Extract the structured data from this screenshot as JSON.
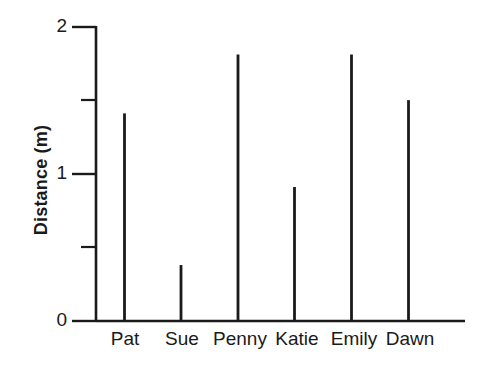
{
  "chart_data": {
    "type": "bar",
    "title": "",
    "subtitle": "",
    "xlabel": "",
    "ylabel": "Distance (m)",
    "categories": [
      "Pat",
      "Sue",
      "Penny",
      "Katie",
      "Emily",
      "Dawn"
    ],
    "values": [
      1.41,
      0.38,
      1.81,
      0.91,
      1.81,
      1.5
    ],
    "series": [
      {
        "name": "Distance",
        "values": [
          1.41,
          0.38,
          1.81,
          0.91,
          1.81,
          1.5
        ]
      }
    ],
    "ylim": [
      0,
      2
    ],
    "xlim": [
      0,
      7
    ],
    "y_major_ticks": [
      0,
      1,
      2
    ],
    "y_major_tick_labels": [
      "0",
      "1",
      "2"
    ],
    "y_minor_ticks": [
      0.5,
      1.5
    ],
    "grid": false,
    "legend": false,
    "legend_position": "none",
    "bar_style": "thin-line",
    "line_color": "#1a1a1a",
    "background_color": "#ffffff",
    "annotations": []
  },
  "axes": {
    "y_axis_name": "distance-axis",
    "x_axis_name": "name-axis"
  }
}
